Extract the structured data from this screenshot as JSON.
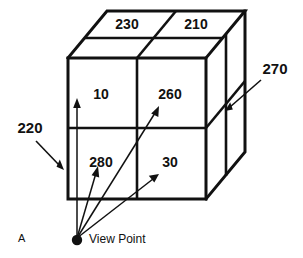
{
  "figure": {
    "letter": "A",
    "type": "patent-line-drawing",
    "background_color": "#ffffff",
    "line_color": "#111111"
  },
  "cube": {
    "description": "Isometric cube subdivided into cells",
    "front_face": {
      "cells": [
        {
          "label": "10",
          "row": 0,
          "col": 0
        },
        {
          "label": "260",
          "row": 0,
          "col": 1
        },
        {
          "label": "280",
          "row": 1,
          "col": 0
        },
        {
          "label": "30",
          "row": 1,
          "col": 1
        }
      ]
    },
    "top_face": {
      "cells": [
        {
          "label": "230",
          "col": 0
        },
        {
          "label": "210",
          "col": 1
        }
      ]
    }
  },
  "reference_numerals": [
    {
      "label": "220",
      "position": "left",
      "points_to": "front-face-left-edge"
    },
    {
      "label": "270",
      "position": "right",
      "points_to": "right-side-face"
    }
  ],
  "viewpoint": {
    "label": "View Point",
    "ray_targets": [
      "10",
      "280",
      "260",
      "30"
    ],
    "ray_count": 4
  }
}
